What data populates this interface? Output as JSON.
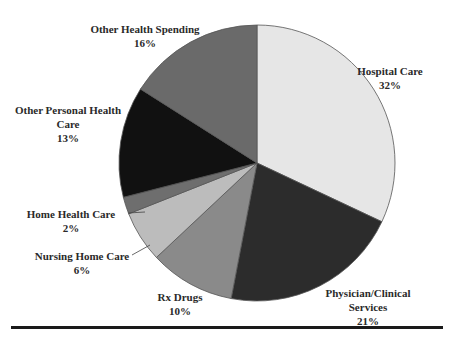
{
  "chart_data": {
    "type": "pie",
    "title": "",
    "start_angle_deg": 0,
    "direction": "clockwise",
    "slices": [
      {
        "label": "Hospital Care",
        "value": 32,
        "color": "#e6e6e6"
      },
      {
        "label": "Physician/Clinical Services",
        "value": 21,
        "color": "#2c2c2c"
      },
      {
        "label": "Rx Drugs",
        "value": 10,
        "color": "#8a8a8a"
      },
      {
        "label": "Nursing Home Care",
        "value": 6,
        "color": "#bcbcbc"
      },
      {
        "label": "Home Health Care",
        "value": 2,
        "color": "#6e6e6e"
      },
      {
        "label": "Other Personal Health Care",
        "value": 13,
        "color": "#111111"
      },
      {
        "label": "Other Health Spending",
        "value": 16,
        "color": "#6a6a6a"
      }
    ],
    "unit": "%"
  },
  "labels": {
    "hospital": {
      "name": "Hospital Care",
      "pct": "32%"
    },
    "physician": {
      "name1": "Physician/Clinical",
      "name2": "Services",
      "pct": "21%"
    },
    "rx": {
      "name": "Rx Drugs",
      "pct": "10%"
    },
    "nursing": {
      "name": "Nursing Home Care",
      "pct": "6%"
    },
    "home": {
      "name": "Home Health Care",
      "pct": "2%"
    },
    "other_personal": {
      "name1": "Other Personal Health",
      "name2": "Care",
      "pct": "13%"
    },
    "other_spending": {
      "name": "Other Health Spending",
      "pct": "16%"
    }
  }
}
